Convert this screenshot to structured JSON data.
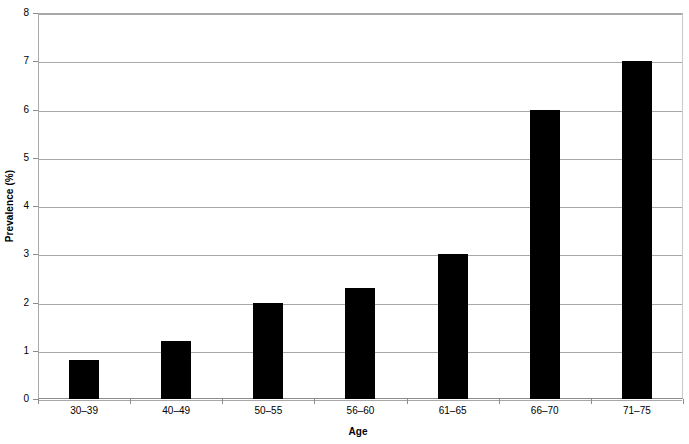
{
  "chart_data": {
    "type": "bar",
    "title": "",
    "xlabel": "Age",
    "ylabel": "Prevalence (%)",
    "categories": [
      "30–39",
      "40–49",
      "50–55",
      "56–60",
      "61–65",
      "66–70",
      "71–75"
    ],
    "values": [
      0.8,
      1.2,
      2.0,
      2.3,
      3.0,
      6.0,
      7.0
    ],
    "series": [
      {
        "name": "Prevalence",
        "values": [
          0.8,
          1.2,
          2.0,
          2.3,
          3.0,
          6.0,
          7.0
        ],
        "color": "#000000"
      }
    ],
    "ylim": [
      0,
      8
    ],
    "ytick_labels": [
      "0",
      "1",
      "2",
      "3",
      "4",
      "5",
      "6",
      "7",
      "8"
    ],
    "ytick_values": [
      0,
      1,
      2,
      3,
      4,
      5,
      6,
      7,
      8
    ],
    "grid": true,
    "grid_axis": "y",
    "grid_color": "#a8a8a8",
    "legend": false,
    "legend_position": "none",
    "bar_color": "#000000",
    "background_color": "#ffffff"
  }
}
